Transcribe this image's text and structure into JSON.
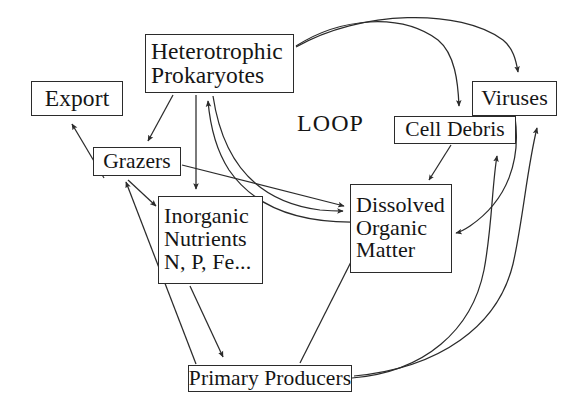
{
  "diagram": {
    "center_label": "LOOP",
    "stroke_color": "#2b2b2b",
    "text_color": "#151515",
    "background_color": "#ffffff",
    "nodes": [
      {
        "id": "heterotrophic-prokaryotes",
        "lines": [
          "Heterotrophic",
          "Prokaryotes"
        ]
      },
      {
        "id": "export",
        "lines": [
          "Export"
        ]
      },
      {
        "id": "grazers",
        "lines": [
          "Grazers"
        ]
      },
      {
        "id": "inorganic-nutrients",
        "lines": [
          "Inorganic",
          "Nutrients",
          "N, P, Fe..."
        ]
      },
      {
        "id": "dissolved-organic-matter",
        "lines": [
          "Dissolved",
          "Organic",
          "Matter"
        ]
      },
      {
        "id": "cell-debris",
        "lines": [
          "Cell Debris"
        ]
      },
      {
        "id": "viruses",
        "lines": [
          "Viruses"
        ]
      },
      {
        "id": "primary-producers",
        "lines": [
          "Primary Producers"
        ]
      }
    ],
    "edges": [
      {
        "from": "heterotrophic-prokaryotes",
        "to": "cell-debris",
        "style": "curved"
      },
      {
        "from": "heterotrophic-prokaryotes",
        "to": "viruses",
        "style": "curved"
      },
      {
        "from": "heterotrophic-prokaryotes",
        "to": "grazers",
        "style": "straight"
      },
      {
        "from": "heterotrophic-prokaryotes",
        "to": "inorganic-nutrients",
        "style": "straight"
      },
      {
        "from": "heterotrophic-prokaryotes",
        "to": "dissolved-organic-matter",
        "style": "curved"
      },
      {
        "from": "dissolved-organic-matter",
        "to": "heterotrophic-prokaryotes",
        "style": "curved"
      },
      {
        "from": "grazers",
        "to": "export",
        "style": "straight"
      },
      {
        "from": "grazers",
        "to": "inorganic-nutrients",
        "style": "straight"
      },
      {
        "from": "grazers",
        "to": "dissolved-organic-matter",
        "style": "straight"
      },
      {
        "from": "cell-debris",
        "to": "dissolved-organic-matter",
        "style": "straight"
      },
      {
        "from": "viruses",
        "to": "dissolved-organic-matter",
        "style": "curved"
      },
      {
        "from": "inorganic-nutrients",
        "to": "primary-producers",
        "style": "straight"
      },
      {
        "from": "primary-producers",
        "to": "grazers",
        "style": "straight"
      },
      {
        "from": "primary-producers",
        "to": "dissolved-organic-matter",
        "style": "straight"
      },
      {
        "from": "primary-producers",
        "to": "cell-debris",
        "style": "curved"
      },
      {
        "from": "primary-producers",
        "to": "viruses",
        "style": "curved"
      }
    ]
  }
}
